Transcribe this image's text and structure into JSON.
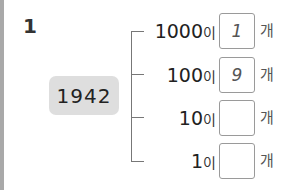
{
  "problem": {
    "number": "1",
    "given_number": "1942",
    "rows": [
      {
        "place": "1000",
        "josa": "이",
        "answer": "1",
        "unit": "개"
      },
      {
        "place": "100",
        "josa": "이",
        "answer": "9",
        "unit": "개"
      },
      {
        "place": "10",
        "josa": "이",
        "answer": "",
        "unit": "개"
      },
      {
        "place": "1",
        "josa": "이",
        "answer": "",
        "unit": "개"
      }
    ]
  },
  "colors": {
    "stripe": "#a9a9a9",
    "number_box_bg": "#dedede",
    "answer_box_border": "#9a9a9a"
  }
}
